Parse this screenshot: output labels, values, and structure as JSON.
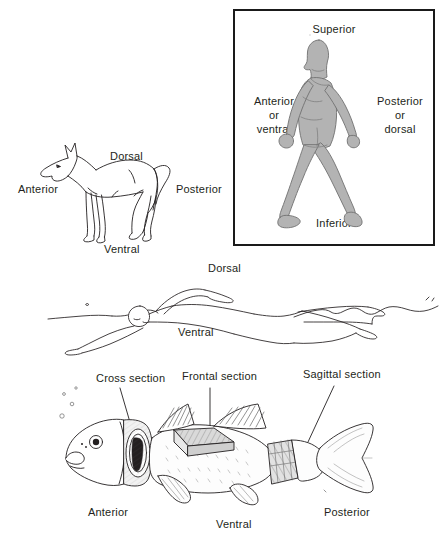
{
  "figure": {
    "line_color": "#231f20",
    "human_fill": "#b3b3b3",
    "human_stroke": "#6e6e6e",
    "box_border_color": "#1a1a1a",
    "background": "#ffffff"
  },
  "human_panel": {
    "name": "human-reference-box",
    "superior": "Superior",
    "inferior": "Inferior",
    "anterior_line1": "Anterior",
    "anterior_line2": "or",
    "anterior_line3": "ventral",
    "posterior_line1": "Posterior",
    "posterior_line2": "or",
    "posterior_line3": "dorsal"
  },
  "dog_panel": {
    "name": "dog-figure",
    "dorsal": "Dorsal",
    "ventral": "Ventral",
    "anterior": "Anterior",
    "posterior": "Posterior"
  },
  "swimmer_panel": {
    "name": "swimmer-figure",
    "dorsal": "Dorsal",
    "ventral": "Ventral"
  },
  "fish_panel": {
    "name": "fish-figure",
    "cross_section": "Cross section",
    "frontal_section": "Frontal section",
    "sagittal_section": "Sagittal section",
    "cephalad": "Cephalad",
    "caudad": "Caudad",
    "anterior": "Anterior",
    "ventral": "Ventral",
    "posterior": "Posterior",
    "cephalad_arrow": "←",
    "caudad_arrow": "→"
  }
}
